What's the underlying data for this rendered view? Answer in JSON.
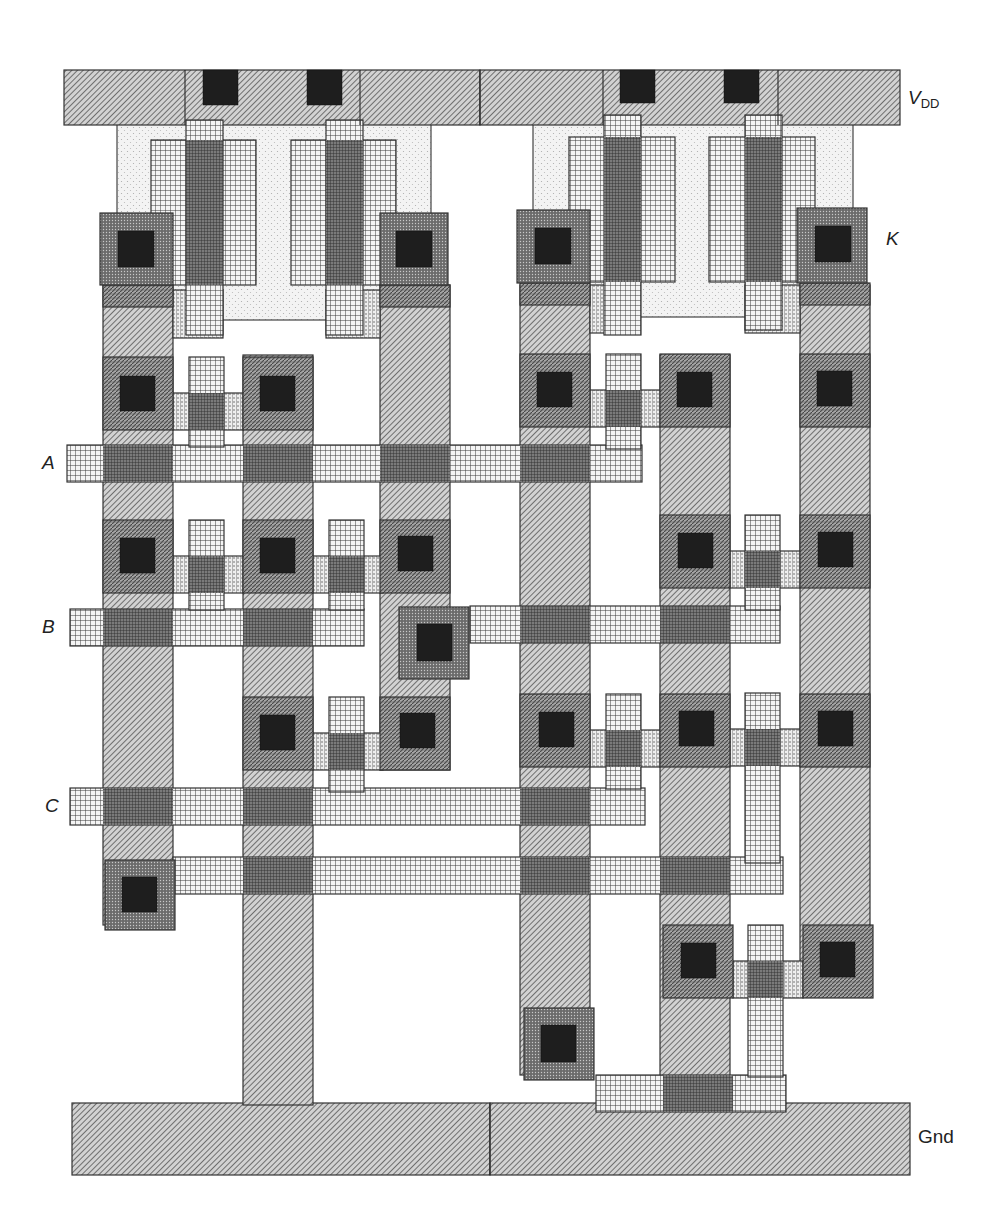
{
  "figure": {
    "type": "CMOS stick/layout diagram",
    "colors": {
      "metal_fill": "#b8b8b8",
      "metal_line": "#444444",
      "poly_line": "#333333",
      "diff_fill": "#8f8f8f",
      "contact": "#1e1e1e",
      "nwell_fill": "#ececec",
      "pselect_fill": "#5a5a5a",
      "outline": "#333333"
    }
  },
  "labels": {
    "vdd_main": "V",
    "vdd_sub": "DD",
    "k": "K",
    "a": "A",
    "b": "B",
    "c": "C",
    "gnd": "Gnd"
  },
  "layers": {
    "nwell": [
      {
        "x": 117,
        "y": 105,
        "w": 314,
        "h": 215
      },
      {
        "x": 533,
        "y": 102,
        "w": 320,
        "h": 215
      }
    ],
    "metal": [
      {
        "x": 64,
        "y": 70,
        "w": 416,
        "h": 55
      },
      {
        "x": 480,
        "y": 70,
        "w": 420,
        "h": 55
      },
      {
        "x": 72,
        "y": 1103,
        "w": 418,
        "h": 72
      },
      {
        "x": 490,
        "y": 1103,
        "w": 420,
        "h": 72
      },
      {
        "x": 103,
        "y": 285,
        "w": 70,
        "h": 640
      },
      {
        "x": 243,
        "y": 355,
        "w": 70,
        "h": 750
      },
      {
        "x": 380,
        "y": 285,
        "w": 70,
        "h": 485
      },
      {
        "x": 520,
        "y": 285,
        "w": 70,
        "h": 790
      },
      {
        "x": 660,
        "y": 355,
        "w": 70,
        "h": 750
      },
      {
        "x": 800,
        "y": 285,
        "w": 70,
        "h": 710
      }
    ],
    "poly": [
      {
        "x": 67,
        "y": 445,
        "w": 575,
        "h": 37
      },
      {
        "x": 70,
        "y": 609,
        "w": 294,
        "h": 37
      },
      {
        "x": 470,
        "y": 606,
        "w": 310,
        "h": 37
      },
      {
        "x": 70,
        "y": 788,
        "w": 575,
        "h": 37
      },
      {
        "x": 173,
        "y": 857,
        "w": 610,
        "h": 37
      },
      {
        "x": 596,
        "y": 1075,
        "w": 190,
        "h": 37
      },
      {
        "x": 186,
        "y": 120,
        "w": 37,
        "h": 215
      },
      {
        "x": 326,
        "y": 120,
        "w": 37,
        "h": 215
      },
      {
        "x": 604,
        "y": 115,
        "w": 37,
        "h": 220
      },
      {
        "x": 745,
        "y": 115,
        "w": 37,
        "h": 215
      },
      {
        "x": 189,
        "y": 357,
        "w": 35,
        "h": 90
      },
      {
        "x": 606,
        "y": 354,
        "w": 35,
        "h": 95
      },
      {
        "x": 189,
        "y": 520,
        "w": 35,
        "h": 90
      },
      {
        "x": 329,
        "y": 520,
        "w": 35,
        "h": 90
      },
      {
        "x": 745,
        "y": 515,
        "w": 35,
        "h": 95
      },
      {
        "x": 329,
        "y": 697,
        "w": 35,
        "h": 95
      },
      {
        "x": 606,
        "y": 694,
        "w": 35,
        "h": 95
      },
      {
        "x": 745,
        "y": 693,
        "w": 35,
        "h": 170
      },
      {
        "x": 748,
        "y": 925,
        "w": 35,
        "h": 152
      }
    ],
    "gate_pdiff": [
      {
        "x": 151,
        "y": 140,
        "w": 105,
        "h": 145
      },
      {
        "x": 291,
        "y": 140,
        "w": 105,
        "h": 145
      },
      {
        "x": 569,
        "y": 137,
        "w": 106,
        "h": 145
      },
      {
        "x": 709,
        "y": 137,
        "w": 106,
        "h": 145
      }
    ],
    "channel": [
      {
        "x": 173,
        "y": 393,
        "w": 70,
        "h": 37
      },
      {
        "x": 590,
        "y": 390,
        "w": 70,
        "h": 37
      },
      {
        "x": 173,
        "y": 556,
        "w": 70,
        "h": 37
      },
      {
        "x": 313,
        "y": 556,
        "w": 70,
        "h": 37
      },
      {
        "x": 730,
        "y": 551,
        "w": 70,
        "h": 37
      },
      {
        "x": 313,
        "y": 733,
        "w": 70,
        "h": 37
      },
      {
        "x": 590,
        "y": 730,
        "w": 70,
        "h": 37
      },
      {
        "x": 730,
        "y": 729,
        "w": 70,
        "h": 37
      },
      {
        "x": 733,
        "y": 961,
        "w": 70,
        "h": 37
      },
      {
        "x": 173,
        "y": 290,
        "w": 50,
        "h": 48
      },
      {
        "x": 326,
        "y": 290,
        "w": 54,
        "h": 48
      },
      {
        "x": 590,
        "y": 285,
        "w": 50,
        "h": 48
      },
      {
        "x": 745,
        "y": 285,
        "w": 55,
        "h": 48
      }
    ],
    "diff_pads": [
      {
        "x": 103,
        "y": 357,
        "w": 70,
        "h": 73
      },
      {
        "x": 243,
        "y": 357,
        "w": 70,
        "h": 73
      },
      {
        "x": 520,
        "y": 354,
        "w": 70,
        "h": 73
      },
      {
        "x": 660,
        "y": 354,
        "w": 70,
        "h": 73
      },
      {
        "x": 800,
        "y": 354,
        "w": 70,
        "h": 73
      },
      {
        "x": 103,
        "y": 520,
        "w": 70,
        "h": 73
      },
      {
        "x": 243,
        "y": 520,
        "w": 70,
        "h": 73
      },
      {
        "x": 380,
        "y": 520,
        "w": 70,
        "h": 73
      },
      {
        "x": 660,
        "y": 515,
        "w": 70,
        "h": 73
      },
      {
        "x": 800,
        "y": 515,
        "w": 70,
        "h": 73
      },
      {
        "x": 243,
        "y": 697,
        "w": 70,
        "h": 73
      },
      {
        "x": 380,
        "y": 697,
        "w": 70,
        "h": 73
      },
      {
        "x": 520,
        "y": 694,
        "w": 70,
        "h": 73
      },
      {
        "x": 660,
        "y": 694,
        "w": 70,
        "h": 73
      },
      {
        "x": 800,
        "y": 694,
        "w": 70,
        "h": 73
      },
      {
        "x": 663,
        "y": 925,
        "w": 70,
        "h": 73
      },
      {
        "x": 803,
        "y": 925,
        "w": 70,
        "h": 73
      },
      {
        "x": 103,
        "y": 285,
        "w": 70,
        "h": 22
      },
      {
        "x": 380,
        "y": 285,
        "w": 70,
        "h": 22
      },
      {
        "x": 520,
        "y": 283,
        "w": 70,
        "h": 22
      },
      {
        "x": 800,
        "y": 283,
        "w": 70,
        "h": 22
      }
    ],
    "pselect_pads": [
      {
        "x": 100,
        "y": 213,
        "w": 73,
        "h": 72
      },
      {
        "x": 380,
        "y": 213,
        "w": 68,
        "h": 72
      },
      {
        "x": 517,
        "y": 210,
        "w": 73,
        "h": 73
      },
      {
        "x": 797,
        "y": 208,
        "w": 70,
        "h": 75
      },
      {
        "x": 399,
        "y": 607,
        "w": 70,
        "h": 72
      },
      {
        "x": 105,
        "y": 860,
        "w": 70,
        "h": 70
      },
      {
        "x": 524,
        "y": 1008,
        "w": 70,
        "h": 72
      }
    ],
    "poly_overlap": [
      {
        "x": 103,
        "y": 445,
        "w": 70,
        "h": 37
      },
      {
        "x": 243,
        "y": 445,
        "w": 70,
        "h": 37
      },
      {
        "x": 380,
        "y": 445,
        "w": 70,
        "h": 37
      },
      {
        "x": 520,
        "y": 445,
        "w": 70,
        "h": 37
      },
      {
        "x": 103,
        "y": 609,
        "w": 70,
        "h": 37
      },
      {
        "x": 243,
        "y": 609,
        "w": 70,
        "h": 37
      },
      {
        "x": 520,
        "y": 606,
        "w": 70,
        "h": 37
      },
      {
        "x": 660,
        "y": 606,
        "w": 70,
        "h": 37
      },
      {
        "x": 103,
        "y": 788,
        "w": 70,
        "h": 37
      },
      {
        "x": 243,
        "y": 788,
        "w": 70,
        "h": 37
      },
      {
        "x": 520,
        "y": 788,
        "w": 70,
        "h": 37
      },
      {
        "x": 243,
        "y": 857,
        "w": 70,
        "h": 37
      },
      {
        "x": 520,
        "y": 857,
        "w": 70,
        "h": 37
      },
      {
        "x": 660,
        "y": 857,
        "w": 70,
        "h": 37
      },
      {
        "x": 663,
        "y": 1075,
        "w": 70,
        "h": 37
      },
      {
        "x": 189,
        "y": 393,
        "w": 35,
        "h": 37
      },
      {
        "x": 606,
        "y": 390,
        "w": 35,
        "h": 37
      },
      {
        "x": 189,
        "y": 556,
        "w": 35,
        "h": 37
      },
      {
        "x": 329,
        "y": 556,
        "w": 35,
        "h": 37
      },
      {
        "x": 745,
        "y": 551,
        "w": 35,
        "h": 37
      },
      {
        "x": 329,
        "y": 733,
        "w": 35,
        "h": 37
      },
      {
        "x": 606,
        "y": 730,
        "w": 35,
        "h": 37
      },
      {
        "x": 745,
        "y": 729,
        "w": 35,
        "h": 37
      },
      {
        "x": 748,
        "y": 961,
        "w": 35,
        "h": 37
      },
      {
        "x": 186,
        "y": 140,
        "w": 37,
        "h": 145
      },
      {
        "x": 326,
        "y": 140,
        "w": 37,
        "h": 145
      },
      {
        "x": 604,
        "y": 137,
        "w": 37,
        "h": 145
      },
      {
        "x": 745,
        "y": 137,
        "w": 37,
        "h": 145
      }
    ],
    "contacts": [
      {
        "x": 203,
        "y": 70,
        "w": 35,
        "h": 35
      },
      {
        "x": 307,
        "y": 70,
        "w": 35,
        "h": 35
      },
      {
        "x": 620,
        "y": 70,
        "w": 35,
        "h": 33
      },
      {
        "x": 724,
        "y": 70,
        "w": 35,
        "h": 33
      },
      {
        "x": 118,
        "y": 231,
        "w": 36,
        "h": 36
      },
      {
        "x": 396,
        "y": 231,
        "w": 36,
        "h": 36
      },
      {
        "x": 535,
        "y": 228,
        "w": 36,
        "h": 36
      },
      {
        "x": 815,
        "y": 226,
        "w": 36,
        "h": 36
      },
      {
        "x": 120,
        "y": 376,
        "w": 35,
        "h": 35
      },
      {
        "x": 260,
        "y": 376,
        "w": 35,
        "h": 35
      },
      {
        "x": 537,
        "y": 372,
        "w": 35,
        "h": 35
      },
      {
        "x": 677,
        "y": 372,
        "w": 35,
        "h": 35
      },
      {
        "x": 817,
        "y": 371,
        "w": 35,
        "h": 35
      },
      {
        "x": 120,
        "y": 538,
        "w": 35,
        "h": 35
      },
      {
        "x": 260,
        "y": 538,
        "w": 35,
        "h": 35
      },
      {
        "x": 398,
        "y": 536,
        "w": 35,
        "h": 35
      },
      {
        "x": 678,
        "y": 533,
        "w": 35,
        "h": 35
      },
      {
        "x": 818,
        "y": 532,
        "w": 35,
        "h": 35
      },
      {
        "x": 417,
        "y": 624,
        "w": 35,
        "h": 37
      },
      {
        "x": 260,
        "y": 715,
        "w": 35,
        "h": 35
      },
      {
        "x": 400,
        "y": 713,
        "w": 35,
        "h": 35
      },
      {
        "x": 539,
        "y": 712,
        "w": 35,
        "h": 35
      },
      {
        "x": 679,
        "y": 711,
        "w": 35,
        "h": 35
      },
      {
        "x": 818,
        "y": 711,
        "w": 35,
        "h": 35
      },
      {
        "x": 122,
        "y": 877,
        "w": 35,
        "h": 35
      },
      {
        "x": 681,
        "y": 943,
        "w": 35,
        "h": 35
      },
      {
        "x": 820,
        "y": 942,
        "w": 35,
        "h": 35
      },
      {
        "x": 541,
        "y": 1025,
        "w": 35,
        "h": 37
      }
    ],
    "rail_dividers": [
      {
        "x1": 185,
        "y1": 70,
        "x2": 185,
        "y2": 125
      },
      {
        "x1": 360,
        "y1": 70,
        "x2": 360,
        "y2": 125
      },
      {
        "x1": 480,
        "y1": 70,
        "x2": 480,
        "y2": 125
      },
      {
        "x1": 603,
        "y1": 70,
        "x2": 603,
        "y2": 125
      },
      {
        "x1": 778,
        "y1": 70,
        "x2": 778,
        "y2": 125
      },
      {
        "x1": 490,
        "y1": 1103,
        "x2": 490,
        "y2": 1175
      }
    ]
  }
}
